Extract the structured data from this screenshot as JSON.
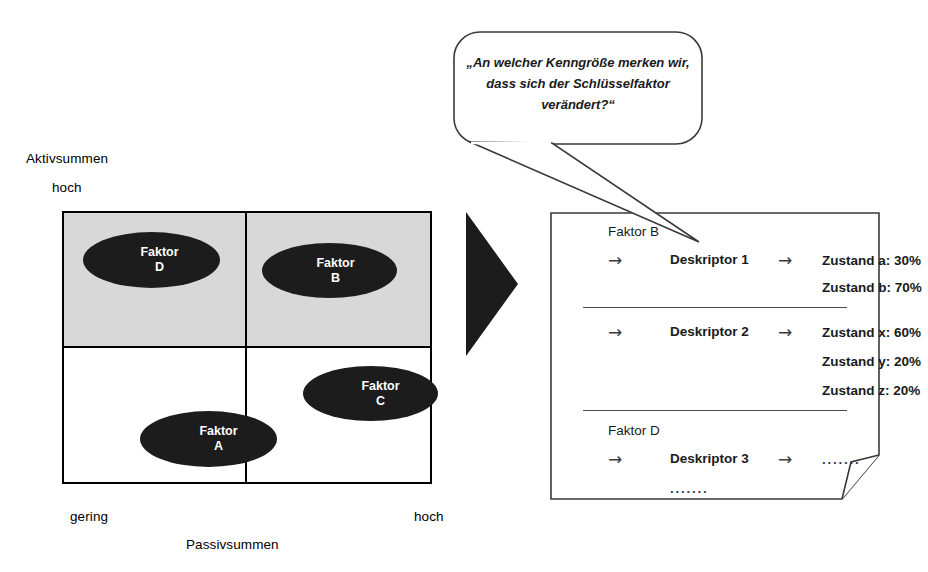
{
  "figure": {
    "matrix": {
      "y_axis_title": "Aktivsummen",
      "y_axis_high": "hoch",
      "x_axis_title": "Passivsummen",
      "x_axis_low": "gering",
      "x_axis_high": "hoch",
      "quadrant_fill_top": "#d8d8d8",
      "quadrant_fill_bottom": "#ffffff",
      "marker_color": "#1c1c1c",
      "markers": [
        {
          "name": "Faktor",
          "id": "D",
          "quadrant": "top-left"
        },
        {
          "name": "Faktor",
          "id": "B",
          "quadrant": "top-right"
        },
        {
          "name": "Faktor",
          "id": "C",
          "quadrant": "bottom-right"
        },
        {
          "name": "Faktor",
          "id": "A",
          "quadrant": "bottom-left"
        }
      ]
    },
    "arrow": {
      "direction": "right",
      "color": "#1c1c1c"
    },
    "callout": {
      "text": "„An welcher Kenngröße merken wir, dass sich der Schlüsselfaktor verändert?“"
    },
    "document": {
      "arrow_glyph": "→",
      "dots": "·······",
      "sections": [
        {
          "factor": "Faktor B",
          "descriptors": [
            {
              "name": "Deskriptor 1",
              "states": [
                "Zustand a: 30%",
                "Zustand b: 70%"
              ]
            },
            {
              "name": "Deskriptor 2",
              "states": [
                "Zustand x: 60%",
                "Zustand y: 20%",
                "Zustand z: 20%"
              ]
            }
          ]
        },
        {
          "factor": "Faktor D",
          "descriptors": [
            {
              "name": "Deskriptor 3",
              "states": [
                "·······"
              ]
            }
          ],
          "trailing_dots": "·······"
        }
      ]
    }
  }
}
